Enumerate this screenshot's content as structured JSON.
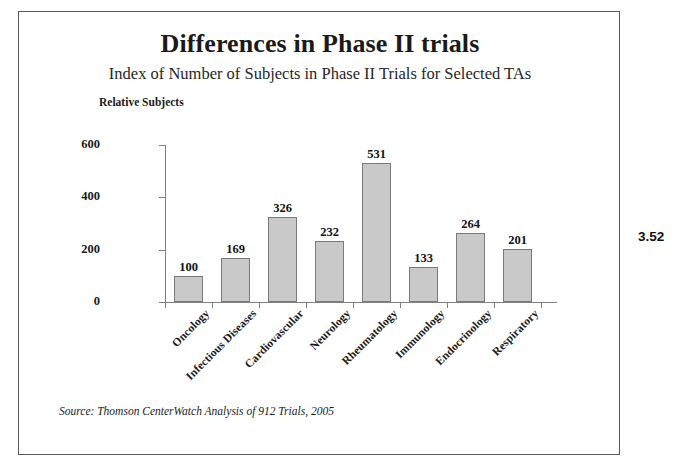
{
  "slide": {
    "title": "Differences in Phase II trials",
    "subtitle": "Index of Number of Subjects in Phase II Trials for Selected TAs",
    "axis_title": "Relative Subjects",
    "source_note": "Source: Thomson CenterWatch Analysis of 912 Trials, 2005",
    "side_annotation": "3.52",
    "border_color": "#595959",
    "background_color": "#ffffff"
  },
  "chart_data": {
    "type": "bar",
    "title": "Differences in Phase II trials",
    "subtitle": "Index of Number of Subjects in Phase II Trials for Selected TAs",
    "xlabel": "",
    "ylabel": "Relative Subjects",
    "ylim": [
      0,
      600
    ],
    "yticks": [
      0,
      200,
      400,
      600
    ],
    "ytick_labels": [
      "0",
      "200",
      "400",
      "600"
    ],
    "grid": false,
    "legend": false,
    "bar_color": "#c9c9c9",
    "bar_border_color": "#7a7a7a",
    "axis_color": "#808080",
    "categories": [
      "Oncology",
      "Infectious Diseases",
      "Cardiovascular",
      "Neurology",
      "Rheumatology",
      "Immunology",
      "Endocrinology",
      "Respiratory"
    ],
    "values": [
      100,
      169,
      326,
      232,
      531,
      133,
      264,
      201
    ],
    "value_labels": [
      "100",
      "169",
      "326",
      "232",
      "531",
      "133",
      "264",
      "201"
    ],
    "source": "Thomson CenterWatch Analysis of 912 Trials, 2005"
  }
}
